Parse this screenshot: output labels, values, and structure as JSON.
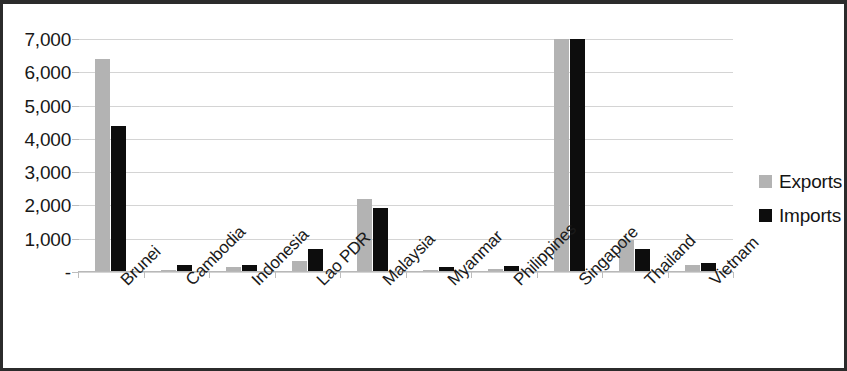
{
  "chart_data": {
    "type": "bar",
    "title": "",
    "subtitle": "",
    "xlabel": "",
    "ylabel": "",
    "categories": [
      "Brunei",
      "Cambodia",
      "Indonesia",
      "Lao PDR",
      "Malaysia",
      "Myanmar",
      "Philippines",
      "Singapore",
      "Thailand",
      "Vietnam"
    ],
    "series": [
      {
        "name": "Exports",
        "color": "#b3b3b3",
        "values": [
          6400,
          50,
          140,
          330,
          2200,
          75,
          80,
          7000,
          950,
          200
        ]
      },
      {
        "name": "Imports",
        "color": "#0d0d0d",
        "values": [
          4400,
          200,
          210,
          700,
          1920,
          165,
          170,
          7000,
          680,
          280
        ]
      }
    ],
    "ylim": [
      0,
      7000
    ],
    "y_ticks": [
      0,
      1000,
      2000,
      3000,
      4000,
      5000,
      6000,
      7000
    ],
    "y_tick_labels": [
      "-",
      "1,000",
      "2,000",
      "3,000",
      "4,000",
      "5,000",
      "6,000",
      "7,000"
    ],
    "grid": true,
    "grid_axis": "y",
    "legend_position": "right",
    "x_tick_label_rotation": -45
  },
  "legend": {
    "entries": [
      {
        "label": "Exports",
        "color": "#b3b3b3"
      },
      {
        "label": "Imports",
        "color": "#0d0d0d"
      }
    ]
  },
  "colors": {
    "exports": "#b3b3b3",
    "imports": "#0d0d0d",
    "gridline": "#d4d4d4",
    "frame": "#2b2b2b",
    "text": "#181818"
  }
}
